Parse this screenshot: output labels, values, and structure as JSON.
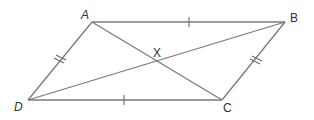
{
  "diagram": {
    "type": "parallelogram",
    "colors": {
      "line": "#7a7a7a",
      "label": "#333333",
      "background": "#ffffff"
    },
    "vertices": {
      "A": {
        "label": "A",
        "x": 92,
        "y": 22
      },
      "B": {
        "label": "B",
        "x": 285,
        "y": 22
      },
      "C": {
        "label": "C",
        "x": 222,
        "y": 100
      },
      "D": {
        "label": "D",
        "x": 28,
        "y": 100
      },
      "X": {
        "label": "X",
        "x": 157,
        "y": 61
      }
    },
    "sides": [
      {
        "name": "AB",
        "ticks": 1
      },
      {
        "name": "BC",
        "ticks": 2
      },
      {
        "name": "CD",
        "ticks": 1
      },
      {
        "name": "DA",
        "ticks": 2
      }
    ],
    "diagonals": [
      "AC",
      "BD"
    ],
    "intersection": "X"
  }
}
